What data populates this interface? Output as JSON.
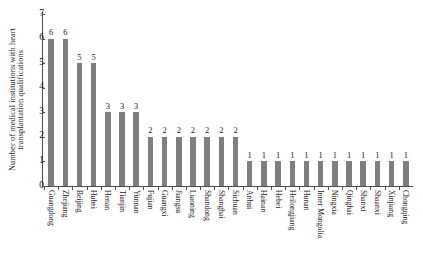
{
  "chart_data": {
    "type": "bar",
    "title": "",
    "xlabel": "",
    "ylabel": "Number of medical institutions with heart transplantation qualifications",
    "ylabel_lines": [
      "Number of medical institutions with heart",
      "transplantation qualifications"
    ],
    "ylim": [
      0,
      7
    ],
    "ytick_labels": [
      "0",
      "1",
      "2",
      "3",
      "4",
      "5",
      "6",
      "7"
    ],
    "ytick_values": [
      0,
      1,
      2,
      3,
      4,
      5,
      6,
      7
    ],
    "grid": false,
    "legend": null,
    "bar_color": "#7f7f7f",
    "axis_color": "#4d4d4d",
    "show_value_labels": true,
    "categories": [
      "Guangdong",
      "Zhejiang",
      "Beijing",
      "Hubei",
      "Henan",
      "Tianjin",
      "Yunnan",
      "Fujian",
      "Guangxi",
      "Jiangsu",
      "Liaoning",
      "Shandong",
      "Shanghai",
      "Sichuan",
      "Anhui",
      "Hainan",
      "Hebei",
      "Heilongjiang",
      "Hunan",
      "Inner Mongolia",
      "Ningxia",
      "Qinghai",
      "Shanxi",
      "Shaanxi",
      "Xinjiang",
      "Chongqing"
    ],
    "values": [
      6,
      6,
      5,
      5,
      3,
      3,
      3,
      2,
      2,
      2,
      2,
      2,
      2,
      2,
      1,
      1,
      1,
      1,
      1,
      1,
      1,
      1,
      1,
      1,
      1,
      1
    ],
    "value_labels": [
      "6",
      "6",
      "5",
      "5",
      "3",
      "3",
      "3",
      "2",
      "2",
      "2",
      "2",
      "2",
      "2",
      "2",
      "1",
      "1",
      "1",
      "1",
      "1",
      "1",
      "1",
      "1",
      "1",
      "1",
      "1",
      "1"
    ]
  }
}
